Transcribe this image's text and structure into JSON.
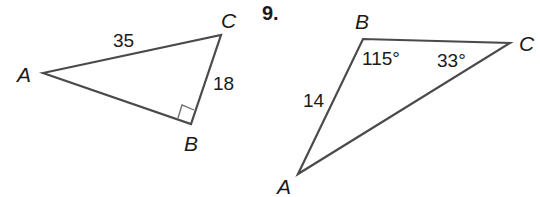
{
  "figures": [
    {
      "id": "triangle-1",
      "vertices": {
        "A": {
          "label": "A",
          "x": 43,
          "y": 73
        },
        "B": {
          "label": "B",
          "x": 191,
          "y": 124
        },
        "C": {
          "label": "C",
          "x": 221,
          "y": 35
        }
      },
      "sides": {
        "AC": {
          "label": "35"
        },
        "BC": {
          "label": "18"
        }
      },
      "right_angle_at": "B"
    },
    {
      "id": "triangle-9",
      "problem_number": "9.",
      "vertices": {
        "A": {
          "label": "A",
          "x": 298,
          "y": 174
        },
        "B": {
          "label": "B",
          "x": 363,
          "y": 39
        },
        "C": {
          "label": "C",
          "x": 510,
          "y": 43
        }
      },
      "sides": {
        "AB": {
          "label": "14"
        }
      },
      "angles": {
        "B": {
          "label": "115°"
        },
        "C": {
          "label": "33°"
        }
      }
    }
  ],
  "colors": {
    "line": "#4a4a4a",
    "text": "#1a1a1a",
    "background": "#ffffff"
  }
}
